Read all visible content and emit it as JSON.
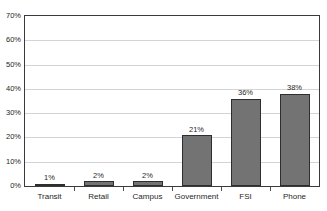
{
  "chart_data": {
    "type": "bar",
    "title": "",
    "xlabel": "",
    "ylabel": "",
    "categories": [
      "Transit",
      "Retail",
      "Campus",
      "Government",
      "FSI",
      "Phone"
    ],
    "values": [
      1,
      2,
      2,
      21,
      36,
      38
    ],
    "value_labels": [
      "1%",
      "2%",
      "2%",
      "21%",
      "36%",
      "38%"
    ],
    "ylim": [
      0,
      70
    ],
    "ytick_values": [
      0,
      10,
      20,
      30,
      40,
      50,
      60,
      70
    ],
    "ytick_labels": [
      "0%",
      "10%",
      "20%",
      "30%",
      "40%",
      "50%",
      "60%",
      "70%"
    ],
    "grid": true,
    "legend": "none",
    "colors": {
      "bar_fill": "#737373",
      "bar_border": "#2e2e2e",
      "gridline": "#d4d4d4",
      "axis": "#3a3a3a",
      "text": "#1f1f1f",
      "background": "#ffffff"
    }
  }
}
